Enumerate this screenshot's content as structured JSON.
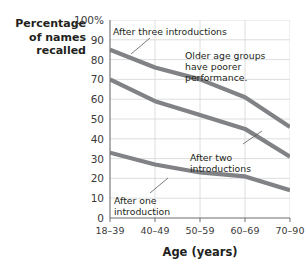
{
  "chart_data": {
    "type": "line",
    "title": "",
    "xlabel": "Age (years)",
    "ylabel": "Percentage of names recalled",
    "categories": [
      "18–39",
      "40–49",
      "50–59",
      "60–69",
      "70–90"
    ],
    "ylim": [
      0,
      100
    ],
    "yticks": [
      "100%",
      "90",
      "80",
      "70",
      "60",
      "50",
      "40",
      "30",
      "20",
      "10",
      "0"
    ],
    "ytick_values": [
      100,
      90,
      80,
      70,
      60,
      50,
      40,
      30,
      20,
      10,
      0
    ],
    "grid": true,
    "legend_position": "none",
    "series": [
      {
        "name": "After three introductions",
        "values": [
          85,
          76,
          70,
          61,
          46
        ],
        "color": "#808285"
      },
      {
        "name": "After two introductions",
        "values": [
          70,
          59,
          52,
          45,
          31
        ],
        "color": "#808285"
      },
      {
        "name": "After one introduction",
        "values": [
          33,
          27,
          23,
          21,
          14
        ],
        "color": "#808285"
      }
    ],
    "annotations": [
      {
        "id": "after-three",
        "text": "After three introductions"
      },
      {
        "id": "older-groups",
        "text": "Older age groups\nhave poorer performance."
      },
      {
        "id": "after-two",
        "text": "After two\nintroductions"
      },
      {
        "id": "after-one",
        "text": "After one\nintroduction"
      }
    ]
  },
  "axis": {
    "y_title_line1": "Percentage",
    "y_title_line2": "of names",
    "y_title_line3": "recalled",
    "x_title": "Age (years)"
  },
  "colors": {
    "line": "#808285",
    "grid": "#d9dadb",
    "axis": "#6d6e71",
    "text": "#231f20"
  }
}
